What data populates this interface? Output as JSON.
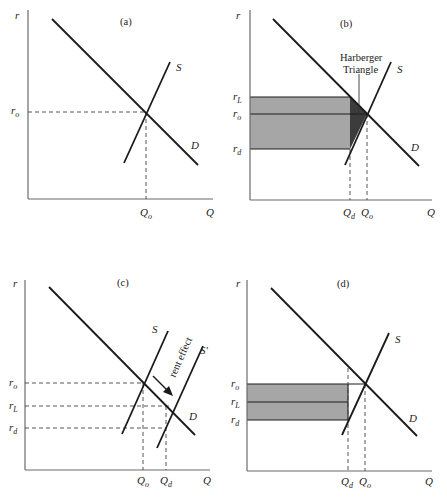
{
  "figure": {
    "panels": [
      {
        "id": "a",
        "label": "(a)",
        "y_axis": "r",
        "x_axis": "Q",
        "curves": [
          "S",
          "D"
        ],
        "y_ticks": [
          {
            "main": "r",
            "sub": "o"
          }
        ],
        "x_ticks": [
          {
            "main": "Q",
            "sub": "o"
          }
        ]
      },
      {
        "id": "b",
        "label": "(b)",
        "y_axis": "r",
        "x_axis": "Q",
        "curves": [
          "S",
          "D"
        ],
        "y_ticks": [
          {
            "main": "r",
            "sub": "L"
          },
          {
            "main": "r",
            "sub": "o"
          },
          {
            "main": "r",
            "sub": "d"
          }
        ],
        "x_ticks": [
          {
            "main": "Q",
            "sub": "d"
          },
          {
            "main": "Q",
            "sub": "o"
          }
        ],
        "annotation_line1": "Harberger",
        "annotation_line2": "Triangle"
      },
      {
        "id": "c",
        "label": "(c)",
        "y_axis": "r",
        "x_axis": "Q",
        "curves": [
          "S",
          "S'",
          "D"
        ],
        "y_ticks": [
          {
            "main": "r",
            "sub": "o"
          },
          {
            "main": "r",
            "sub": "L"
          },
          {
            "main": "r",
            "sub": "d"
          }
        ],
        "x_ticks": [
          {
            "main": "Q",
            "sub": "o"
          },
          {
            "main": "Q",
            "sub": "d"
          }
        ],
        "annotation": "rent effect"
      },
      {
        "id": "d",
        "label": "(d)",
        "y_axis": "r",
        "x_axis": "Q",
        "curves": [
          "S",
          "D"
        ],
        "y_ticks": [
          {
            "main": "r",
            "sub": "o"
          },
          {
            "main": "r",
            "sub": "L"
          },
          {
            "main": "r",
            "sub": "d"
          }
        ],
        "x_ticks": [
          {
            "main": "Q",
            "sub": "d"
          },
          {
            "main": "Q",
            "sub": "o"
          }
        ]
      }
    ],
    "colors": {
      "shaded_area": "#a6a6a6",
      "harberger_triangle": "#3c3c3c",
      "curve": "#1a1a1a",
      "axis": "#6b6b6b"
    }
  }
}
